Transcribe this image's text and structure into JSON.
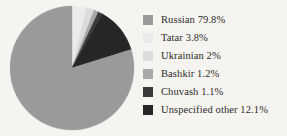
{
  "background_color": "#f6f4f0",
  "chart_data": {
    "type": "pie",
    "title": "",
    "subtitle": "",
    "xlabel": "",
    "ylabel": "",
    "grid": false,
    "legend_position": "right",
    "start_angle_deg": 0,
    "direction": "clockwise",
    "categories": [
      "Russian",
      "Tatar",
      "Ukrainian",
      "Bashkir",
      "Chuvash",
      "Unspecified other"
    ],
    "values": [
      79.8,
      3.8,
      2.0,
      1.2,
      1.1,
      12.1
    ],
    "value_unit": "%",
    "colors": [
      "#9a9a9a",
      "#ebebeb",
      "#dcdcdc",
      "#a8a8a8",
      "#3a3a3a",
      "#262626"
    ],
    "slices": [
      {
        "label": "Russian",
        "value": 79.8,
        "value_text": "79.8%",
        "color": "#9a9a9a"
      },
      {
        "label": "Tatar",
        "value": 3.8,
        "value_text": "3.8%",
        "color": "#ebebeb"
      },
      {
        "label": "Ukrainian",
        "value": 2.0,
        "value_text": "2%",
        "color": "#dcdcdc"
      },
      {
        "label": "Bashkir",
        "value": 1.2,
        "value_text": "1.2%",
        "color": "#a8a8a8"
      },
      {
        "label": "Chuvash",
        "value": 1.1,
        "value_text": "1.1%",
        "color": "#3a3a3a"
      },
      {
        "label": "Unspecified other",
        "value": 12.1,
        "value_text": "12.1%",
        "color": "#262626"
      }
    ]
  },
  "legend": {
    "items": [
      {
        "text": "Russian 79.8%",
        "swatch_color": "#9a9a9a",
        "swatch_name": "legend-swatch-russian"
      },
      {
        "text": "Tatar 3.8%",
        "swatch_color": "#ebebeb",
        "swatch_name": "legend-swatch-tatar"
      },
      {
        "text": "Ukrainian 2%",
        "swatch_color": "#dcdcdc",
        "swatch_name": "legend-swatch-ukrainian"
      },
      {
        "text": "Bashkir 1.2%",
        "swatch_color": "#a8a8a8",
        "swatch_name": "legend-swatch-bashkir"
      },
      {
        "text": "Chuvash 1.1%",
        "swatch_color": "#3a3a3a",
        "swatch_name": "legend-swatch-chuvash"
      },
      {
        "text": "Unspecified other 12.1%",
        "swatch_color": "#262626",
        "swatch_name": "legend-swatch-unspecified-other"
      }
    ]
  },
  "pie_geometry": {
    "center_x": 62,
    "center_y": 66,
    "radius": 62
  }
}
